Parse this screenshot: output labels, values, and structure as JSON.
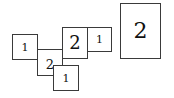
{
  "diagram": {
    "boxes": [
      {
        "id": "left-1",
        "label": "1"
      },
      {
        "id": "middle-2",
        "label": "2"
      },
      {
        "id": "upper-2",
        "label": "2"
      },
      {
        "id": "upper-1",
        "label": "1"
      },
      {
        "id": "bottom-1",
        "label": "1"
      },
      {
        "id": "right-2",
        "label": "2"
      }
    ]
  }
}
